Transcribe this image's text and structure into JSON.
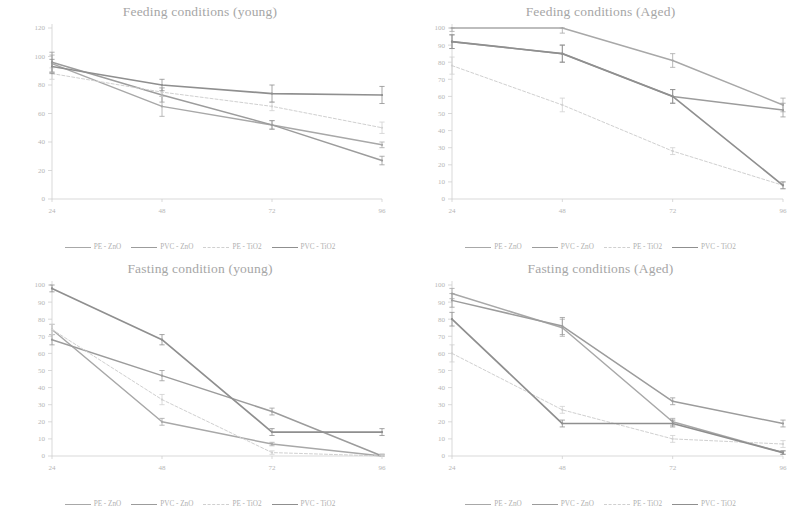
{
  "page": {
    "background": "#ffffff",
    "layout": "2x2 grid of faded line charts (scanned figure)"
  },
  "series_styles": [
    {
      "key": "pe_zno",
      "label": "PE - ZnO",
      "color": "#a8a8a8",
      "width": 1.5,
      "dash": "none"
    },
    {
      "key": "pvc_zno",
      "label": "PVC - ZnO",
      "color": "#9c9c9c",
      "width": 1.5,
      "dash": "none"
    },
    {
      "key": "pe_tio2",
      "label": "PE - TiO2",
      "color": "#d0d0d0",
      "width": 1.0,
      "dash": "3,2"
    },
    {
      "key": "pvc_tio2",
      "label": "PVC - TiO2",
      "color": "#8f8f8f",
      "width": 1.7,
      "dash": "none"
    }
  ],
  "chart_data": [
    {
      "id": "feeding-young",
      "type": "line",
      "title": "Feeding conditions (young)",
      "xlabel": "",
      "ylabel": "",
      "categories": [
        "24",
        "48",
        "72",
        "96"
      ],
      "x": [
        24,
        48,
        72,
        96
      ],
      "xlim": [
        24,
        96
      ],
      "ylim": [
        0,
        120
      ],
      "yticks": [
        "0",
        "20",
        "40",
        "60",
        "80",
        "100",
        "120"
      ],
      "ytick_values": [
        0,
        20,
        40,
        60,
        80,
        100,
        120
      ],
      "grid": false,
      "legend_position": "bottom",
      "series": [
        {
          "name": "PE - ZnO",
          "values": [
            95,
            65,
            52,
            38
          ],
          "errors": [
            6,
            7,
            3,
            2
          ]
        },
        {
          "name": "PVC - ZnO",
          "values": [
            96,
            73,
            52,
            27
          ],
          "errors": [
            7,
            5,
            3,
            3
          ]
        },
        {
          "name": "PE - TiO2",
          "values": [
            88,
            75,
            65,
            50
          ],
          "errors": [
            4,
            3,
            3,
            4
          ]
        },
        {
          "name": "PVC - TiO2",
          "values": [
            93,
            80,
            74,
            73
          ],
          "errors": [
            5,
            4,
            6,
            6
          ]
        }
      ]
    },
    {
      "id": "feeding-aged",
      "type": "line",
      "title": "Feeding conditions (Aged)",
      "xlabel": "",
      "ylabel": "",
      "categories": [
        "24",
        "48",
        "72",
        "96"
      ],
      "x": [
        24,
        48,
        72,
        96
      ],
      "xlim": [
        24,
        96
      ],
      "ylim": [
        0,
        100
      ],
      "yticks": [
        "0",
        "10",
        "20",
        "30",
        "40",
        "50",
        "60",
        "70",
        "80",
        "90",
        "100"
      ],
      "ytick_values": [
        0,
        10,
        20,
        30,
        40,
        50,
        60,
        70,
        80,
        90,
        100
      ],
      "grid": false,
      "legend_position": "bottom",
      "series": [
        {
          "name": "PE - ZnO",
          "values": [
            100,
            100,
            81,
            55
          ],
          "errors": [
            2,
            3,
            4,
            4
          ]
        },
        {
          "name": "PVC - ZnO",
          "values": [
            92,
            85,
            60,
            52
          ],
          "errors": [
            4,
            5,
            4,
            4
          ]
        },
        {
          "name": "PE - TiO2",
          "values": [
            78,
            55,
            28,
            8
          ],
          "errors": [
            5,
            4,
            2,
            2
          ]
        },
        {
          "name": "PVC - TiO2",
          "values": [
            92,
            85,
            60,
            8
          ],
          "errors": [
            4,
            5,
            4,
            2
          ]
        }
      ]
    },
    {
      "id": "fasting-young",
      "type": "line",
      "title": "Fasting condition (young)",
      "xlabel": "",
      "ylabel": "",
      "categories": [
        "24",
        "48",
        "72",
        "96"
      ],
      "x": [
        24,
        48,
        72,
        96
      ],
      "xlim": [
        24,
        96
      ],
      "ylim": [
        0,
        100
      ],
      "yticks": [
        "0",
        "10",
        "20",
        "30",
        "40",
        "50",
        "60",
        "70",
        "80",
        "90",
        "100"
      ],
      "ytick_values": [
        0,
        10,
        20,
        30,
        40,
        50,
        60,
        70,
        80,
        90,
        100
      ],
      "grid": false,
      "legend_position": "bottom",
      "series": [
        {
          "name": "PE - ZnO",
          "values": [
            74,
            20,
            7,
            0
          ],
          "errors": [
            3,
            2,
            1,
            1
          ]
        },
        {
          "name": "PVC - ZnO",
          "values": [
            68,
            47,
            26,
            0
          ],
          "errors": [
            3,
            3,
            2,
            1
          ]
        },
        {
          "name": "PE - TiO2",
          "values": [
            74,
            33,
            2,
            0
          ],
          "errors": [
            3,
            3,
            1,
            1
          ]
        },
        {
          "name": "PVC - TiO2",
          "values": [
            98,
            68,
            14,
            14
          ],
          "errors": [
            2,
            3,
            2,
            2
          ]
        }
      ]
    },
    {
      "id": "fasting-aged",
      "type": "line",
      "title": "Fasting conditions (Aged)",
      "xlabel": "",
      "ylabel": "",
      "categories": [
        "24",
        "48",
        "72",
        "96"
      ],
      "x": [
        24,
        48,
        72,
        96
      ],
      "xlim": [
        24,
        96
      ],
      "ylim": [
        0,
        100
      ],
      "yticks": [
        "0",
        "10",
        "20",
        "30",
        "40",
        "50",
        "60",
        "70",
        "80",
        "90",
        "100"
      ],
      "ytick_values": [
        0,
        10,
        20,
        30,
        40,
        50,
        60,
        70,
        80,
        90,
        100
      ],
      "grid": false,
      "legend_position": "bottom",
      "series": [
        {
          "name": "PE - ZnO",
          "values": [
            95,
            75,
            20,
            2
          ],
          "errors": [
            3,
            5,
            2,
            1
          ]
        },
        {
          "name": "PVC - ZnO",
          "values": [
            91,
            76,
            32,
            19
          ],
          "errors": [
            4,
            5,
            2,
            2
          ]
        },
        {
          "name": "PE - TiO2",
          "values": [
            60,
            27,
            10,
            7
          ],
          "errors": [
            5,
            2,
            2,
            2
          ]
        },
        {
          "name": "PVC - TiO2",
          "values": [
            80,
            19,
            19,
            2
          ],
          "errors": [
            4,
            2,
            2,
            1
          ]
        }
      ]
    }
  ]
}
